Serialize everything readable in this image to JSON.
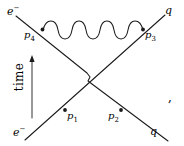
{
  "figure": {
    "kind": "feynman-diagram",
    "background_color": "#ffffff",
    "line_color": "#1a1a1a",
    "trailing_punctuation": ","
  },
  "axis": {
    "time_label": "time",
    "arrow_direction": "up"
  },
  "external_legs": [
    {
      "id": "leg-electron-in",
      "label": "e",
      "superscript": "−",
      "x": 8,
      "y": 6
    },
    {
      "id": "leg-quark-out",
      "label": "q",
      "superscript": "",
      "x": 165,
      "y": 6
    },
    {
      "id": "leg-electron-initial",
      "label": "e",
      "superscript": "−",
      "x": 14,
      "y": 128
    },
    {
      "id": "leg-quark-in",
      "label": "q",
      "superscript": "",
      "x": 150,
      "y": 128
    }
  ],
  "momentum_labels": [
    {
      "id": "momentum-p4",
      "base": "p",
      "sub": "4",
      "x": 26,
      "y": 32
    },
    {
      "id": "momentum-p3",
      "base": "p",
      "sub": "3",
      "x": 145,
      "y": 32
    },
    {
      "id": "momentum-p1",
      "base": "p",
      "sub": "1",
      "x": 66,
      "y": 112
    },
    {
      "id": "momentum-p2",
      "base": "p",
      "sub": "2",
      "x": 113,
      "y": 112
    }
  ],
  "vertices": [
    {
      "id": "vertex-p4",
      "x": 42,
      "y": 29
    },
    {
      "id": "vertex-p3",
      "x": 143,
      "y": 29
    },
    {
      "id": "vertex-p1",
      "x": 65,
      "y": 110
    },
    {
      "id": "vertex-p2",
      "x": 121,
      "y": 110
    }
  ],
  "propagator": {
    "type": "photon",
    "style": "wavy",
    "from_vertex": "vertex-p4",
    "to_vertex": "vertex-p3",
    "oscillations": 5
  },
  "fermion_lines": [
    {
      "id": "fermion-line-electron",
      "from": [
        14,
        16
      ],
      "to": [
        170,
        140
      ],
      "note": "e- upper-left to q lower-right, passes over crossing"
    },
    {
      "id": "fermion-line-quark",
      "from": [
        24,
        140
      ],
      "to": [
        166,
        14
      ],
      "note": "e- lower-left to q upper-right"
    }
  ],
  "crossing": {
    "id": "line-crossing-hop",
    "x": 92,
    "y": 78,
    "style": "hop-jog"
  }
}
